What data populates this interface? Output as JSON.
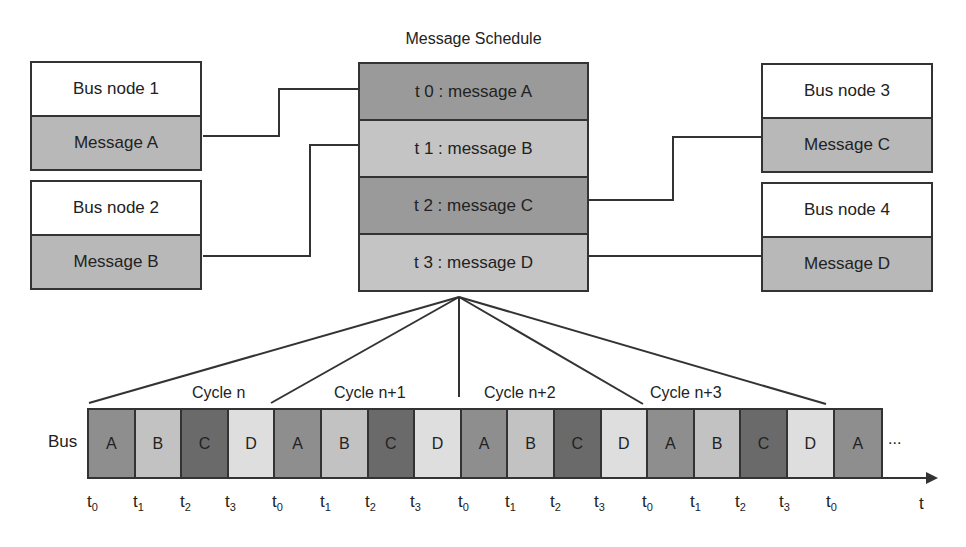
{
  "schedule": {
    "title": "Message Schedule",
    "rows": [
      {
        "label": "t 0 : message A",
        "color": "#9a9a9a"
      },
      {
        "label": "t 1 : message B",
        "color": "#c4c4c4"
      },
      {
        "label": "t 2 : message C",
        "color": "#9a9a9a"
      },
      {
        "label": "t 3 : message D",
        "color": "#c4c4c4"
      }
    ]
  },
  "nodes": [
    {
      "name": "Bus node 1",
      "message": "Message A"
    },
    {
      "name": "Bus node 2",
      "message": "Message B"
    },
    {
      "name": "Bus node 3",
      "message": "Message C"
    },
    {
      "name": "Bus node 4",
      "message": "Message D"
    }
  ],
  "bus": {
    "label": "Bus",
    "cells": [
      {
        "label": "A",
        "color": "#8e8e8e"
      },
      {
        "label": "B",
        "color": "#c2c2c2"
      },
      {
        "label": "C",
        "color": "#6a6a6a"
      },
      {
        "label": "D",
        "color": "#dedede"
      },
      {
        "label": "A",
        "color": "#8e8e8e"
      },
      {
        "label": "B",
        "color": "#c2c2c2"
      },
      {
        "label": "C",
        "color": "#6a6a6a"
      },
      {
        "label": "D",
        "color": "#dedede"
      },
      {
        "label": "A",
        "color": "#8e8e8e"
      },
      {
        "label": "B",
        "color": "#c2c2c2"
      },
      {
        "label": "C",
        "color": "#6a6a6a"
      },
      {
        "label": "D",
        "color": "#dedede"
      },
      {
        "label": "A",
        "color": "#8e8e8e"
      },
      {
        "label": "B",
        "color": "#c2c2c2"
      },
      {
        "label": "C",
        "color": "#6a6a6a"
      },
      {
        "label": "D",
        "color": "#dedede"
      },
      {
        "label": "A",
        "color": "#8e8e8e"
      }
    ],
    "continuation": "...",
    "cycles": [
      "Cycle n",
      "Cycle n+1",
      "Cycle n+2",
      "Cycle n+3"
    ],
    "ticks": [
      {
        "base": "t",
        "sub": "0"
      },
      {
        "base": "t",
        "sub": "1"
      },
      {
        "base": "t",
        "sub": "2"
      },
      {
        "base": "t",
        "sub": "3"
      },
      {
        "base": "t",
        "sub": "0"
      },
      {
        "base": "t",
        "sub": "1"
      },
      {
        "base": "t",
        "sub": "2"
      },
      {
        "base": "t",
        "sub": "3"
      },
      {
        "base": "t",
        "sub": "0"
      },
      {
        "base": "t",
        "sub": "1"
      },
      {
        "base": "t",
        "sub": "2"
      },
      {
        "base": "t",
        "sub": "3"
      },
      {
        "base": "t",
        "sub": "0"
      },
      {
        "base": "t",
        "sub": "1"
      },
      {
        "base": "t",
        "sub": "2"
      },
      {
        "base": "t",
        "sub": "3"
      },
      {
        "base": "t",
        "sub": "0"
      }
    ],
    "axis_label": "t"
  }
}
